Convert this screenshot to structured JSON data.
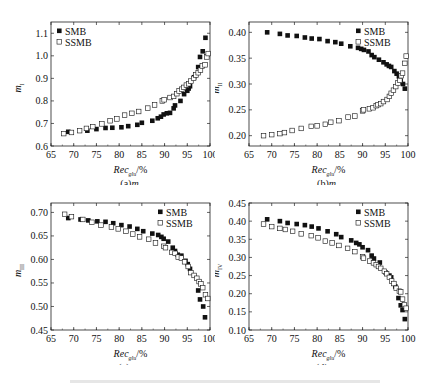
{
  "figure": {
    "caption_legible": false
  },
  "chart_data": [
    {
      "type": "scatter",
      "panel_label": "(a)m",
      "panel_sub": "I",
      "ylabel": "m",
      "ylabel_sub": "I",
      "xlabel": "Rec",
      "xlabel_sub": "glu",
      "xlabel_unit": "/%",
      "xlim": [
        65,
        100
      ],
      "ylim": [
        0.6,
        1.15
      ],
      "xticks": [
        65,
        70,
        75,
        80,
        85,
        90,
        95,
        100
      ],
      "yticks": [
        0.6,
        0.7,
        0.8,
        0.9,
        1.0,
        1.1
      ],
      "ytick_fmt": 1,
      "legend": {
        "position": "upper-left",
        "entries": [
          "SMB",
          "SSMB"
        ]
      },
      "series": [
        {
          "name": "SMB",
          "marker": "filled-square",
          "x": [
            68.8,
            73.0,
            75.0,
            77.0,
            78.5,
            80.5,
            82.0,
            84.0,
            85.0,
            87.3,
            88.5,
            89.2,
            89.8,
            90.5,
            91.2,
            92.0,
            92.3,
            93.5,
            94.3,
            95.0,
            95.3,
            95.6,
            96.5,
            97.4,
            97.8,
            98.4,
            99.0
          ],
          "y": [
            0.663,
            0.668,
            0.675,
            0.68,
            0.681,
            0.683,
            0.688,
            0.694,
            0.703,
            0.712,
            0.723,
            0.73,
            0.74,
            0.745,
            0.747,
            0.767,
            0.78,
            0.8,
            0.83,
            0.845,
            0.855,
            0.865,
            0.905,
            0.95,
            0.995,
            1.02,
            1.08
          ]
        },
        {
          "name": "SSMB",
          "marker": "open-square",
          "x": [
            67.8,
            69.5,
            71.3,
            72.8,
            74.2,
            76.2,
            78.0,
            79.5,
            81.2,
            82.8,
            84.3,
            86.3,
            87.8,
            89.5,
            89.9,
            91.2,
            92.0,
            92.7,
            93.2,
            93.8,
            94.2,
            94.8,
            95.3,
            95.8,
            96.4,
            96.9,
            97.4,
            97.9,
            98.3,
            98.9,
            99.3,
            99.6
          ],
          "y": [
            0.655,
            0.66,
            0.668,
            0.678,
            0.686,
            0.698,
            0.712,
            0.72,
            0.737,
            0.745,
            0.753,
            0.768,
            0.782,
            0.8,
            0.805,
            0.815,
            0.82,
            0.832,
            0.844,
            0.852,
            0.86,
            0.87,
            0.876,
            0.888,
            0.9,
            0.915,
            0.925,
            0.937,
            0.955,
            0.96,
            0.995,
            1.01
          ]
        }
      ]
    },
    {
      "type": "scatter",
      "panel_label": "(b)m",
      "panel_sub": "II",
      "ylabel": "m",
      "ylabel_sub": "II",
      "xlabel": "Rec",
      "xlabel_sub": "glu",
      "xlabel_unit": "/%",
      "xlim": [
        65,
        100
      ],
      "ylim": [
        0.18,
        0.42
      ],
      "xticks": [
        65,
        70,
        75,
        80,
        85,
        90,
        95,
        100
      ],
      "yticks": [
        0.2,
        0.25,
        0.3,
        0.35,
        0.4
      ],
      "ytick_fmt": 2,
      "legend": {
        "position": "upper-right",
        "entries": [
          "SMB",
          "SSMB"
        ]
      },
      "series": [
        {
          "name": "SMB",
          "marker": "filled-square",
          "x": [
            69.0,
            71.8,
            73.5,
            75.5,
            77.3,
            78.8,
            80.5,
            82.3,
            84.0,
            85.3,
            87.3,
            89.0,
            89.7,
            90.3,
            91.3,
            92.0,
            92.6,
            93.6,
            94.6,
            95.3,
            95.8,
            96.3,
            97.0,
            97.5,
            98.0,
            98.4,
            98.9,
            99.3
          ],
          "y": [
            0.4,
            0.397,
            0.394,
            0.393,
            0.39,
            0.388,
            0.387,
            0.383,
            0.381,
            0.378,
            0.373,
            0.37,
            0.368,
            0.366,
            0.363,
            0.356,
            0.352,
            0.347,
            0.342,
            0.338,
            0.335,
            0.333,
            0.325,
            0.32,
            0.315,
            0.306,
            0.3,
            0.291
          ]
        },
        {
          "name": "SSMB",
          "marker": "open-square",
          "x": [
            68.2,
            70.0,
            71.8,
            72.8,
            74.5,
            76.5,
            78.7,
            80.0,
            81.8,
            83.0,
            84.8,
            86.8,
            88.3,
            90.0,
            90.2,
            91.5,
            92.3,
            93.0,
            93.4,
            94.0,
            94.6,
            95.4,
            95.9,
            96.3,
            96.8,
            97.3,
            97.8,
            98.2,
            98.5,
            98.8,
            99.3,
            99.6
          ],
          "y": [
            0.2,
            0.202,
            0.204,
            0.206,
            0.21,
            0.214,
            0.218,
            0.219,
            0.222,
            0.226,
            0.229,
            0.236,
            0.238,
            0.248,
            0.25,
            0.252,
            0.254,
            0.258,
            0.26,
            0.262,
            0.266,
            0.27,
            0.276,
            0.282,
            0.288,
            0.295,
            0.302,
            0.307,
            0.316,
            0.321,
            0.34,
            0.354
          ]
        }
      ]
    },
    {
      "type": "scatter",
      "panel_label": "(c)m",
      "panel_sub": "III",
      "ylabel": "m",
      "ylabel_sub": "III",
      "xlabel": "Rec",
      "xlabel_sub": "glu",
      "xlabel_unit": "/%",
      "xlim": [
        65,
        100
      ],
      "ylim": [
        0.45,
        0.72
      ],
      "xticks": [
        65,
        70,
        75,
        80,
        85,
        90,
        95,
        100
      ],
      "yticks": [
        0.45,
        0.5,
        0.55,
        0.6,
        0.65,
        0.7
      ],
      "ytick_fmt": 2,
      "legend": {
        "position": "upper-right",
        "entries": [
          "SMB",
          "SSMB"
        ]
      },
      "series": [
        {
          "name": "SMB",
          "marker": "filled-square",
          "x": [
            68.8,
            71.5,
            73.2,
            75.2,
            77.0,
            78.7,
            80.5,
            82.3,
            84.0,
            85.3,
            87.3,
            88.6,
            89.3,
            89.8,
            90.8,
            91.8,
            92.3,
            92.9,
            93.7,
            94.6,
            95.1,
            95.6,
            97.4,
            97.8,
            98.5,
            98.9
          ],
          "y": [
            0.688,
            0.685,
            0.683,
            0.681,
            0.68,
            0.677,
            0.673,
            0.67,
            0.665,
            0.66,
            0.655,
            0.652,
            0.648,
            0.644,
            0.638,
            0.625,
            0.618,
            0.61,
            0.608,
            0.597,
            0.59,
            0.58,
            0.534,
            0.515,
            0.5,
            0.477
          ]
        },
        {
          "name": "SSMB",
          "marker": "open-square",
          "x": [
            68.0,
            69.5,
            72.0,
            74.0,
            76.0,
            78.3,
            79.8,
            81.5,
            83.0,
            84.5,
            86.5,
            88.0,
            89.8,
            90.2,
            91.6,
            92.3,
            93.0,
            93.7,
            94.4,
            95.2,
            95.8,
            96.5,
            97.1,
            97.6,
            98.0,
            98.4,
            99.0,
            99.5
          ],
          "y": [
            0.696,
            0.691,
            0.685,
            0.679,
            0.673,
            0.669,
            0.665,
            0.66,
            0.654,
            0.648,
            0.643,
            0.635,
            0.628,
            0.625,
            0.615,
            0.613,
            0.605,
            0.603,
            0.595,
            0.585,
            0.572,
            0.566,
            0.56,
            0.553,
            0.548,
            0.54,
            0.525,
            0.517
          ]
        }
      ]
    },
    {
      "type": "scatter",
      "panel_label": "(d)m",
      "panel_sub": "IV",
      "ylabel": "m",
      "ylabel_sub": "IV",
      "xlabel": "Rec",
      "xlabel_sub": "glu",
      "xlabel_unit": "/%",
      "xlim": [
        65,
        100
      ],
      "ylim": [
        0.1,
        0.45
      ],
      "xticks": [
        65,
        70,
        75,
        80,
        85,
        90,
        95,
        100
      ],
      "yticks": [
        0.1,
        0.15,
        0.2,
        0.25,
        0.3,
        0.35,
        0.4,
        0.45
      ],
      "ytick_fmt": 2,
      "legend": {
        "position": "upper-right",
        "entries": [
          "SMB",
          "SSMB"
        ]
      },
      "series": [
        {
          "name": "SMB",
          "marker": "filled-square",
          "x": [
            69.0,
            71.8,
            73.5,
            75.5,
            77.3,
            78.8,
            80.3,
            82.3,
            84.2,
            85.3,
            87.5,
            88.6,
            89.3,
            90.0,
            91.2,
            92.0,
            92.5,
            93.8,
            95.1,
            95.9,
            96.3,
            97.2,
            97.9,
            98.4,
            98.8,
            99.3
          ],
          "y": [
            0.405,
            0.4,
            0.395,
            0.392,
            0.389,
            0.385,
            0.38,
            0.372,
            0.364,
            0.356,
            0.347,
            0.34,
            0.336,
            0.328,
            0.32,
            0.305,
            0.297,
            0.286,
            0.258,
            0.25,
            0.245,
            0.22,
            0.188,
            0.168,
            0.155,
            0.13
          ]
        },
        {
          "name": "SSMB",
          "marker": "open-square",
          "x": [
            68.2,
            70.0,
            71.8,
            73.0,
            74.6,
            76.5,
            78.7,
            80.2,
            81.8,
            83.3,
            84.8,
            86.7,
            88.3,
            90.0,
            90.2,
            91.6,
            92.4,
            93.0,
            93.5,
            94.0,
            94.8,
            95.3,
            95.9,
            96.4,
            96.9,
            97.4,
            98.1,
            98.4,
            98.8,
            99.2,
            99.6
          ],
          "y": [
            0.392,
            0.385,
            0.38,
            0.377,
            0.372,
            0.365,
            0.36,
            0.354,
            0.345,
            0.34,
            0.333,
            0.325,
            0.316,
            0.302,
            0.298,
            0.29,
            0.285,
            0.28,
            0.275,
            0.27,
            0.262,
            0.255,
            0.245,
            0.235,
            0.228,
            0.215,
            0.207,
            0.205,
            0.185,
            0.17,
            0.16
          ]
        }
      ]
    }
  ]
}
